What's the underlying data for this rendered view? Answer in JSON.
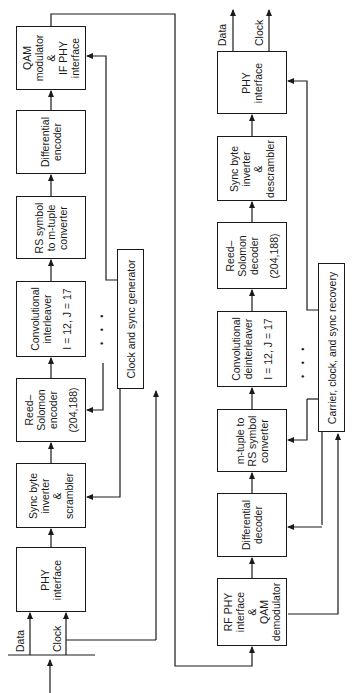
{
  "transmitter": {
    "inputs": {
      "data": "Data",
      "clock": "Clock"
    },
    "blocks": [
      {
        "id": "phy-interface-tx",
        "lines": [
          "PHY",
          "interface"
        ]
      },
      {
        "id": "sync-byte-inverter-scrambler",
        "lines": [
          "Sync byte",
          "inverter",
          "&",
          "scrambler"
        ]
      },
      {
        "id": "reed-solomon-encoder",
        "lines": [
          "Reed–",
          "Solomon",
          "encoder",
          "(204,188)"
        ]
      },
      {
        "id": "convolutional-interleaver",
        "lines": [
          "Convolutional",
          "interleaver",
          "I = 12, J = 17"
        ]
      },
      {
        "id": "rs-symbol-to-mtuple",
        "lines": [
          "RS symbol",
          "to m-tuple",
          "converter"
        ]
      },
      {
        "id": "differential-encoder",
        "lines": [
          "Differential",
          "encoder"
        ]
      },
      {
        "id": "qam-modulator",
        "lines": [
          "QAM",
          "modulator",
          "&",
          "IF PHY",
          "interface"
        ]
      }
    ],
    "clock_block": "Clock and sync generator",
    "ellipsis": "• • •"
  },
  "receiver": {
    "outputs": {
      "data": "Data",
      "clock": "Clock"
    },
    "blocks": [
      {
        "id": "rf-phy-qam-demodulator",
        "lines": [
          "RF PHY",
          "interface",
          "&",
          "QAM",
          "demodulator"
        ]
      },
      {
        "id": "differential-decoder",
        "lines": [
          "Differential",
          "decoder"
        ]
      },
      {
        "id": "mtuple-to-rs-symbol",
        "lines": [
          "m-tuple to",
          "RS symbol",
          "converter"
        ]
      },
      {
        "id": "convolutional-deinterleaver",
        "lines": [
          "Convolutional",
          "deinterleaver",
          "I = 12, J = 17"
        ]
      },
      {
        "id": "reed-solomon-decoder",
        "lines": [
          "Reed–",
          "Solomon",
          "decoder",
          "(204,188)"
        ]
      },
      {
        "id": "sync-byte-inverter-descrambler",
        "lines": [
          "Sync byte",
          "inverter",
          "&",
          "descrambler"
        ]
      },
      {
        "id": "phy-interface-rx",
        "lines": [
          "PHY",
          "interface"
        ]
      }
    ],
    "recovery_block": "Carrier, clock, and sync recovery",
    "ellipsis": "• • •"
  }
}
